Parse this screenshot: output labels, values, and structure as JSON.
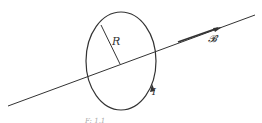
{
  "diagram": {
    "labels": {
      "radius": "R",
      "field": "𝓑",
      "current": "I",
      "caption_fragment": "F: 1.1"
    },
    "colors": {
      "stroke": "#333333",
      "background": "#ffffff"
    }
  }
}
